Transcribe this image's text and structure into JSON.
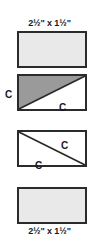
{
  "diagram": {
    "labels": {
      "top_dimension": "2½\" x 1½\"",
      "bottom_dimension": "2½\" x 1½\""
    },
    "fabric_tags": {
      "outside_left": "C",
      "block2_white_half": "C",
      "block3_upper_right": "C",
      "block3_lower_left": "C"
    },
    "colors": {
      "outline": "#2b2b2b",
      "light_fabric": "#e9e9e9",
      "medium_fabric": "#9a9a9a",
      "white_fabric": "#ffffff",
      "text": "#1a1a1a",
      "background": "#ffffff"
    },
    "blocks": [
      {
        "index": 1,
        "name": "plain-light-rectangle",
        "fill": "light",
        "diagonal": "none"
      },
      {
        "index": 2,
        "name": "half-square-triangle-shaded",
        "fill": "medium-upper-left",
        "diagonal": "bottom-left-to-top-right"
      },
      {
        "index": 3,
        "name": "half-square-triangle-outline",
        "fill": "white",
        "diagonal": "top-left-to-bottom-right"
      },
      {
        "index": 4,
        "name": "plain-light-rectangle",
        "fill": "light",
        "diagonal": "none"
      }
    ]
  }
}
